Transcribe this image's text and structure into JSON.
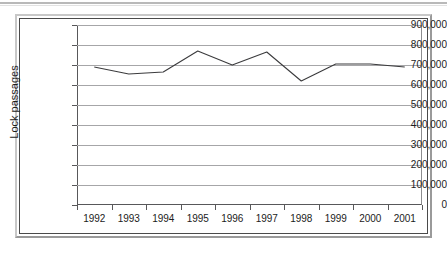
{
  "chart_data": {
    "type": "line",
    "title": "",
    "xlabel": "",
    "ylabel": "Lock passages",
    "categories": [
      "1992",
      "1993",
      "1994",
      "1995",
      "1996",
      "1997",
      "1998",
      "1999",
      "2000",
      "2001"
    ],
    "values": [
      690000,
      655000,
      665000,
      770000,
      700000,
      765000,
      620000,
      705000,
      705000,
      690000
    ],
    "series": [
      {
        "name": "Lock passages",
        "values": [
          690000,
          655000,
          665000,
          770000,
          700000,
          765000,
          620000,
          705000,
          705000,
          690000
        ]
      }
    ],
    "ylim": [
      0,
      900000
    ],
    "ytick_labels": [
      "0",
      "100,000",
      "200,000",
      "300,000",
      "400,000",
      "500,000",
      "600,000",
      "700,000",
      "800,000",
      "900,000"
    ],
    "ytick_values": [
      0,
      100000,
      200000,
      300000,
      400000,
      500000,
      600000,
      700000,
      800000,
      900000
    ],
    "grid": "horizontal",
    "legend": "none",
    "line_color": "#3b3b3d",
    "grid_color": "#a6a6a8",
    "axis_color": "#58585a",
    "text_color": "#1c1c1c",
    "background_color": "#ffffff"
  },
  "figure": {
    "border_color": "#4a4a4a",
    "frame_light": "#c8c8c8",
    "frame_dark": "#9a9a9a",
    "top_rule_color": "#b9b9b9"
  }
}
